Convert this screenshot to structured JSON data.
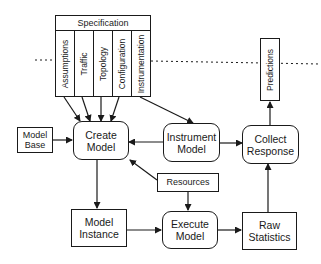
{
  "diagram": {
    "specification": {
      "title": "Specification",
      "columns": [
        "Assumptions",
        "Traffic",
        "Topology",
        "Configuration",
        "Instrumentation"
      ]
    },
    "nodes": {
      "model_base": "Model Base",
      "create_model": "Create Model",
      "instrument_model": "Instrument Model",
      "collect_response": "Collect Response",
      "predictions": "Predictions",
      "resources": "Resources",
      "model_instance": "Model Instance",
      "execute_model": "Execute Model",
      "raw_statistics": "Raw Statistics"
    },
    "edges": [
      {
        "from": "Assumptions",
        "to": "Create Model"
      },
      {
        "from": "Traffic",
        "to": "Create Model"
      },
      {
        "from": "Topology",
        "to": "Create Model"
      },
      {
        "from": "Configuration",
        "to": "Create Model"
      },
      {
        "from": "Instrumentation",
        "to": "Instrument Model"
      },
      {
        "from": "Model Base",
        "to": "Create Model"
      },
      {
        "from": "Instrument Model",
        "to": "Create Model"
      },
      {
        "from": "Instrument Model",
        "to": "Collect Response"
      },
      {
        "from": "Collect Response",
        "to": "Predictions"
      },
      {
        "from": "Resources",
        "to": "Create Model"
      },
      {
        "from": "Resources",
        "to": "Execute Model"
      },
      {
        "from": "Create Model",
        "to": "Model Instance"
      },
      {
        "from": "Model Instance",
        "to": "Execute Model"
      },
      {
        "from": "Execute Model",
        "to": "Raw Statistics"
      },
      {
        "from": "Raw Statistics",
        "to": "Collect Response"
      }
    ],
    "dotted_separator": true
  }
}
